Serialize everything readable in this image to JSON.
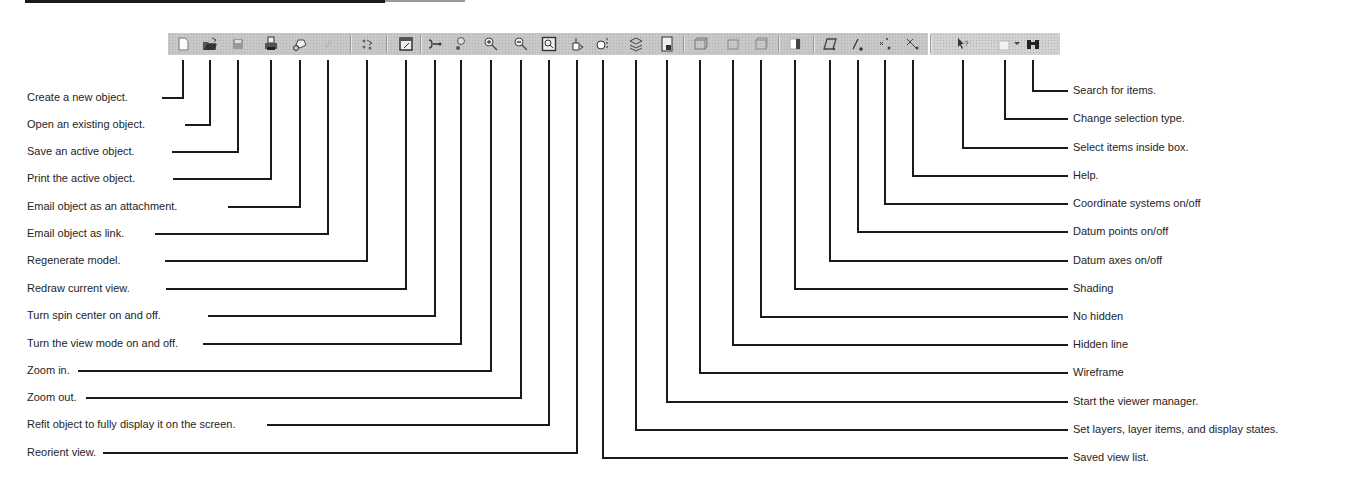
{
  "diagram": {
    "left_callouts": [
      {
        "id": "new",
        "label": "Create a new object.",
        "icon": "new-file-icon",
        "x": 183,
        "y": 97
      },
      {
        "id": "open",
        "label": "Open an existing object.",
        "icon": "open-folder-icon",
        "x": 210,
        "y": 124
      },
      {
        "id": "save",
        "label": "Save an active object.",
        "icon": "save-icon",
        "x": 238,
        "y": 151
      },
      {
        "id": "print",
        "label": "Print the active object.",
        "icon": "printer-icon",
        "x": 271,
        "y": 178
      },
      {
        "id": "email-attach",
        "label": "Email object as an attachment.",
        "icon": "email-attachment-icon",
        "x": 300,
        "y": 206
      },
      {
        "id": "email-link",
        "label": "Email object as link.",
        "icon": "email-link-icon",
        "x": 328,
        "y": 233
      },
      {
        "id": "regen",
        "label": "Regenerate model.",
        "icon": "regenerate-icon",
        "x": 367,
        "y": 260
      },
      {
        "id": "redraw",
        "label": "Redraw current view.",
        "icon": "redraw-icon",
        "x": 406,
        "y": 288
      },
      {
        "id": "spin",
        "label": "Turn spin center on and off.",
        "icon": "spin-center-icon",
        "x": 435,
        "y": 315
      },
      {
        "id": "viewmode",
        "label": "Turn the view mode on and off.",
        "icon": "view-mode-icon",
        "x": 461,
        "y": 343
      },
      {
        "id": "zoomin",
        "label": "Zoom in.",
        "icon": "zoom-in-icon",
        "x": 491,
        "y": 370
      },
      {
        "id": "zoomout",
        "label": "Zoom out.",
        "icon": "zoom-out-icon",
        "x": 521,
        "y": 397
      },
      {
        "id": "refit",
        "label": "Refit object to fully display it on the screen.",
        "icon": "refit-icon",
        "x": 549,
        "y": 424
      },
      {
        "id": "reorient",
        "label": "Reorient view.",
        "icon": "reorient-icon",
        "x": 577,
        "y": 452
      }
    ],
    "right_callouts": [
      {
        "id": "search",
        "label": "Search for items.",
        "icon": "search-binoculars-icon",
        "x": 1033,
        "y": 90
      },
      {
        "id": "seltype",
        "label": "Change selection type.",
        "icon": "selection-type-icon",
        "x": 1005,
        "y": 118
      },
      {
        "id": "selbox",
        "label": "Select items inside box.",
        "icon": "select-box-icon",
        "x": 963,
        "y": 147
      },
      {
        "id": "help",
        "label": "Help.",
        "icon": "help-icon",
        "x": 913,
        "y": 175
      },
      {
        "id": "csys",
        "label": "Coordinate systems on/off",
        "icon": "coordinate-systems-icon",
        "x": 885,
        "y": 203
      },
      {
        "id": "points",
        "label": "Datum points on/off",
        "icon": "datum-points-icon",
        "x": 858,
        "y": 231
      },
      {
        "id": "axes",
        "label": "Datum axes on/off",
        "icon": "datum-axes-icon",
        "x": 830,
        "y": 260
      },
      {
        "id": "shading",
        "label": "Shading",
        "icon": "shading-icon",
        "x": 795,
        "y": 288
      },
      {
        "id": "nohidden",
        "label": "No hidden",
        "icon": "no-hidden-icon",
        "x": 761,
        "y": 316
      },
      {
        "id": "hidden",
        "label": "Hidden line",
        "icon": "hidden-line-icon",
        "x": 733,
        "y": 344
      },
      {
        "id": "wireframe",
        "label": "Wireframe",
        "icon": "wireframe-icon",
        "x": 700,
        "y": 372
      },
      {
        "id": "viewer",
        "label": "Start the viewer manager.",
        "icon": "view-manager-icon",
        "x": 667,
        "y": 401
      },
      {
        "id": "layers",
        "label": "Set layers, layer items, and display states.",
        "icon": "layers-icon",
        "x": 636,
        "y": 429
      },
      {
        "id": "savedview",
        "label": "Saved view list.",
        "icon": "saved-view-list-icon",
        "x": 603,
        "y": 457
      }
    ]
  }
}
